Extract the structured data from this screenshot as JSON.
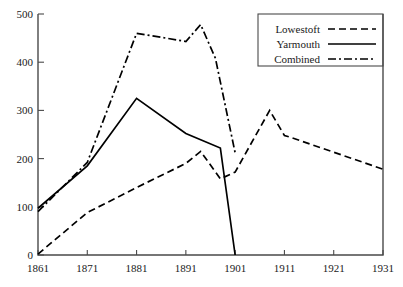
{
  "chart_data": {
    "type": "line",
    "title": "",
    "xlabel": "",
    "ylabel": "",
    "xlim": [
      1861,
      1931
    ],
    "ylim": [
      0,
      500
    ],
    "grid": false,
    "legend_position": "top-right",
    "x_ticks": [
      1861,
      1871,
      1881,
      1891,
      1901,
      1911,
      1921,
      1931
    ],
    "y_ticks": [
      0,
      100,
      200,
      300,
      400,
      500
    ],
    "series": [
      {
        "name": "Lowestoft",
        "style": "dashed",
        "x": [
          1861,
          1871,
          1881,
          1891,
          1894,
          1898,
          1901,
          1908,
          1911,
          1912,
          1931
        ],
        "values": [
          2,
          88,
          140,
          190,
          215,
          158,
          172,
          300,
          248,
          245,
          178
        ]
      },
      {
        "name": "Yarmouth",
        "style": "solid",
        "x": [
          1861,
          1871,
          1881,
          1891,
          1898,
          1901
        ],
        "values": [
          97,
          185,
          325,
          252,
          222,
          0
        ]
      },
      {
        "name": "Combined",
        "style": "dashdot",
        "x": [
          1861,
          1871,
          1881,
          1884,
          1891,
          1894,
          1897,
          1901
        ],
        "values": [
          90,
          192,
          460,
          455,
          443,
          478,
          408,
          212
        ]
      }
    ]
  },
  "legend": {
    "entries": [
      {
        "label": "Lowestoft",
        "style": "dashed"
      },
      {
        "label": "Yarmouth",
        "style": "solid"
      },
      {
        "label": "Combined",
        "style": "dashdot"
      }
    ]
  },
  "colors": {
    "ink": "#000000",
    "axis": "#4a4a4a",
    "background": "#ffffff"
  }
}
